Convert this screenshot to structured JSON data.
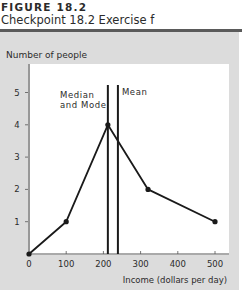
{
  "figure": {
    "label": "FIGURE 18.2",
    "title": "Checkpoint 18.2 Exercise f"
  },
  "chart_data": {
    "type": "line",
    "title": "Checkpoint 18.2 Exercise f",
    "xlabel": "Income (dollars per day)",
    "ylabel": "Number of people",
    "x": [
      0,
      100,
      212,
      320,
      500
    ],
    "values": [
      0,
      1,
      4,
      2,
      1
    ],
    "xlim": [
      0,
      540
    ],
    "ylim": [
      0,
      5.5
    ],
    "xticks": [
      0,
      100,
      200,
      300,
      400,
      500
    ],
    "yticks": [
      1,
      2,
      3,
      4,
      5
    ],
    "grid": false,
    "annotations": [
      {
        "label": "Median and Mode",
        "x": 212,
        "type": "vertical-line"
      },
      {
        "label": "Mean",
        "x": 239,
        "type": "vertical-line"
      }
    ]
  },
  "colors": {
    "panel": "#dcdcdc",
    "plot": "#ffffff",
    "line": "#1a1a1a"
  }
}
